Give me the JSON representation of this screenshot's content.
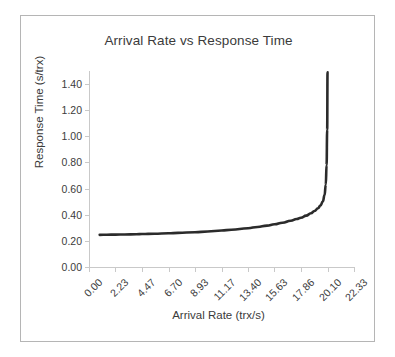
{
  "chart_data": {
    "type": "line",
    "title": "Arrival Rate vs Response Time",
    "xlabel": "Arrival Rate (trx/s)",
    "ylabel": "Response Time (s/trx)",
    "xlim": [
      0.0,
      22.33
    ],
    "ylim": [
      0.0,
      1.5
    ],
    "grid": false,
    "legend": null,
    "x_tick_labels": [
      "0.00",
      "2.23",
      "4.47",
      "6.70",
      "8.93",
      "11.17",
      "13.40",
      "15.63",
      "17.86",
      "20.10",
      "22.33"
    ],
    "x_tick_values": [
      0.0,
      2.23,
      4.47,
      6.7,
      8.93,
      11.17,
      13.4,
      15.63,
      17.86,
      20.1,
      22.33
    ],
    "y_tick_labels": [
      "0.00",
      "0.20",
      "0.40",
      "0.60",
      "0.80",
      "1.00",
      "1.20",
      "1.40"
    ],
    "y_tick_values": [
      0.0,
      0.2,
      0.4,
      0.6,
      0.8,
      1.0,
      1.2,
      1.4
    ],
    "series": [
      {
        "name": "Response Time",
        "color": "#2b2b2b",
        "line_width": 2.6,
        "x": [
          0.9,
          1.5,
          2.23,
          3.0,
          4.0,
          4.47,
          5.5,
          6.7,
          7.5,
          8.93,
          10.0,
          11.17,
          12.0,
          13.4,
          14.2,
          15.0,
          15.63,
          16.3,
          17.0,
          17.5,
          17.86,
          18.3,
          18.7,
          19.0,
          19.3,
          19.5,
          19.7,
          19.85,
          19.95,
          20.02,
          20.07,
          20.1
        ],
        "y": [
          0.246,
          0.247,
          0.248,
          0.249,
          0.251,
          0.252,
          0.255,
          0.258,
          0.261,
          0.266,
          0.272,
          0.279,
          0.285,
          0.297,
          0.306,
          0.317,
          0.327,
          0.339,
          0.354,
          0.367,
          0.377,
          0.393,
          0.411,
          0.428,
          0.45,
          0.47,
          0.5,
          0.55,
          0.63,
          0.78,
          1.05,
          1.49
        ]
      }
    ]
  }
}
